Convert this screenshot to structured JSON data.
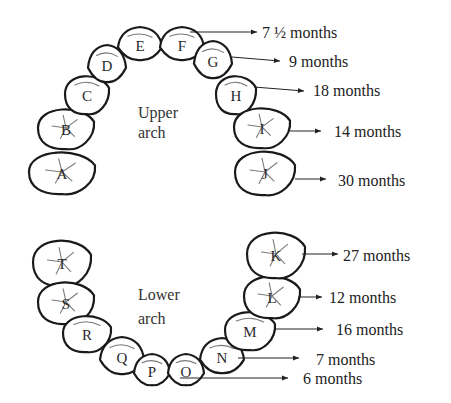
{
  "figure": {
    "upper_arch": {
      "label_line1": "Upper",
      "label_line2": "arch",
      "teeth": [
        {
          "letter": "A",
          "cx": 62,
          "cy": 172,
          "rx": 33,
          "ry": 22,
          "type": "molar"
        },
        {
          "letter": "B",
          "cx": 66,
          "cy": 128,
          "rx": 28,
          "ry": 21,
          "type": "molar"
        },
        {
          "letter": "C",
          "cx": 87,
          "cy": 94,
          "rx": 22,
          "ry": 20,
          "type": "canine"
        },
        {
          "letter": "D",
          "cx": 107,
          "cy": 64,
          "rx": 19,
          "ry": 19,
          "type": "incisor"
        },
        {
          "letter": "E",
          "cx": 140,
          "cy": 44,
          "rx": 22,
          "ry": 17,
          "type": "incisor"
        },
        {
          "letter": "F",
          "cx": 182,
          "cy": 44,
          "rx": 22,
          "ry": 17,
          "type": "incisor"
        },
        {
          "letter": "G",
          "cx": 213,
          "cy": 60,
          "rx": 19,
          "ry": 19,
          "type": "incisor"
        },
        {
          "letter": "H",
          "cx": 236,
          "cy": 94,
          "rx": 20,
          "ry": 20,
          "type": "canine"
        },
        {
          "letter": "I",
          "cx": 262,
          "cy": 127,
          "rx": 28,
          "ry": 21,
          "type": "molar"
        },
        {
          "letter": "J",
          "cx": 265,
          "cy": 172,
          "rx": 30,
          "ry": 23,
          "type": "molar"
        }
      ]
    },
    "lower_arch": {
      "label_line1": "Lower",
      "label_line2": "arch",
      "teeth": [
        {
          "letter": "T",
          "cx": 62,
          "cy": 262,
          "rx": 29,
          "ry": 24,
          "type": "molar"
        },
        {
          "letter": "S",
          "cx": 66,
          "cy": 302,
          "rx": 28,
          "ry": 22,
          "type": "molar"
        },
        {
          "letter": "R",
          "cx": 87,
          "cy": 333,
          "rx": 24,
          "ry": 19,
          "type": "canine"
        },
        {
          "letter": "Q",
          "cx": 122,
          "cy": 356,
          "rx": 22,
          "ry": 19,
          "type": "incisor"
        },
        {
          "letter": "P",
          "cx": 152,
          "cy": 370,
          "rx": 18,
          "ry": 16,
          "type": "incisor"
        },
        {
          "letter": "O",
          "cx": 186,
          "cy": 370,
          "rx": 18,
          "ry": 16,
          "type": "incisor"
        },
        {
          "letter": "N",
          "cx": 222,
          "cy": 356,
          "rx": 22,
          "ry": 18,
          "type": "incisor"
        },
        {
          "letter": "M",
          "cx": 250,
          "cy": 330,
          "rx": 25,
          "ry": 20,
          "type": "canine"
        },
        {
          "letter": "L",
          "cx": 272,
          "cy": 296,
          "rx": 28,
          "ry": 22,
          "type": "molar"
        },
        {
          "letter": "K",
          "cx": 276,
          "cy": 254,
          "rx": 29,
          "ry": 24,
          "type": "molar"
        }
      ]
    },
    "annotations": [
      {
        "tooth": "F",
        "text": "7 ½ months",
        "x1": 190,
        "y1": 32,
        "x2": 257,
        "y2": 32,
        "tx": 262,
        "ty": 38
      },
      {
        "tooth": "G",
        "text": "9 months",
        "x1": 232,
        "y1": 57,
        "x2": 280,
        "y2": 61,
        "tx": 289,
        "ty": 67
      },
      {
        "tooth": "H",
        "text": "18 months",
        "x1": 254,
        "y1": 87,
        "x2": 304,
        "y2": 91,
        "tx": 313,
        "ty": 96
      },
      {
        "tooth": "I",
        "text": "14 months",
        "x1": 290,
        "y1": 131,
        "x2": 321,
        "y2": 131,
        "tx": 334,
        "ty": 137
      },
      {
        "tooth": "J",
        "text": "30 months",
        "x1": 295,
        "y1": 179,
        "x2": 326,
        "y2": 179,
        "tx": 338,
        "ty": 186
      },
      {
        "tooth": "K",
        "text": "27 months",
        "x1": 302,
        "y1": 254,
        "x2": 338,
        "y2": 254,
        "tx": 343,
        "ty": 261
      },
      {
        "tooth": "L",
        "text": "12 months",
        "x1": 298,
        "y1": 297,
        "x2": 322,
        "y2": 297,
        "tx": 329,
        "ty": 303
      },
      {
        "tooth": "M",
        "text": "16 months",
        "x1": 276,
        "y1": 329,
        "x2": 323,
        "y2": 329,
        "tx": 336,
        "ty": 335
      },
      {
        "tooth": "N",
        "text": "7 months",
        "x1": 238,
        "y1": 358,
        "x2": 299,
        "y2": 358,
        "tx": 316,
        "ty": 365
      },
      {
        "tooth": "O",
        "text": "6 months",
        "x1": 180,
        "y1": 378,
        "x2": 288,
        "y2": 378,
        "tx": 303,
        "ty": 384
      }
    ]
  }
}
